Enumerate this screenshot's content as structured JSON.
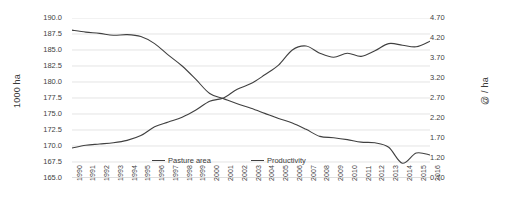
{
  "chart_data": {
    "type": "line",
    "title": "",
    "xlabel": "",
    "ylabel": "1000 ha",
    "y2label": "@ / ha",
    "grid": true,
    "legend_position": "bottom-center",
    "x": [
      1990,
      1991,
      1992,
      1993,
      1994,
      1995,
      1996,
      1997,
      1998,
      1999,
      2000,
      2001,
      2002,
      2003,
      2004,
      2005,
      2006,
      2007,
      2008,
      2009,
      2010,
      2011,
      2012,
      2013,
      2014,
      2015,
      2016
    ],
    "xtick_labels": [
      "1990",
      "1991",
      "1992",
      "1993",
      "1994",
      "1995",
      "1996",
      "1997",
      "1998",
      "1999",
      "2000",
      "2001",
      "2002",
      "2003",
      "2004",
      "2005",
      "2006",
      "2007",
      "2008",
      "2009",
      "2010",
      "2011",
      "2012",
      "2013",
      "2014",
      "2015",
      "2016"
    ],
    "ylim": [
      165.0,
      190.0
    ],
    "ytick_labels": [
      "190.0",
      "187.5",
      "185.0",
      "182.5",
      "180.0",
      "177.5",
      "175.0",
      "172.5",
      "170.0",
      "167.5",
      "165.0"
    ],
    "ytick_values": [
      190.0,
      187.5,
      185.0,
      182.5,
      180.0,
      177.5,
      175.0,
      172.5,
      170.0,
      167.5,
      165.0
    ],
    "y2lim": [
      0.7,
      4.7
    ],
    "y2tick_labels": [
      "4.70",
      "4.20",
      "3.70",
      "3.20",
      "2.70",
      "2.20",
      "1.70",
      "1.20",
      "0.70"
    ],
    "y2tick_values": [
      4.7,
      4.2,
      3.7,
      3.2,
      2.7,
      2.2,
      1.7,
      1.2,
      0.7
    ],
    "series": [
      {
        "name": "Pasture area",
        "axis": "left",
        "color": "#404040",
        "values": [
          188.1,
          187.8,
          187.6,
          187.3,
          187.4,
          187.1,
          186.0,
          184.2,
          182.5,
          180.4,
          178.2,
          177.4,
          176.6,
          175.9,
          175.1,
          174.3,
          173.6,
          172.6,
          171.5,
          171.3,
          171.0,
          170.6,
          170.5,
          169.8,
          167.3,
          168.9,
          168.6
        ]
      },
      {
        "name": "Productivity",
        "axis": "right",
        "color": "#404040",
        "values": [
          1.45,
          1.52,
          1.55,
          1.58,
          1.64,
          1.76,
          1.98,
          2.1,
          2.22,
          2.4,
          2.62,
          2.7,
          2.92,
          3.06,
          3.28,
          3.52,
          3.9,
          4.0,
          3.82,
          3.72,
          3.82,
          3.74,
          3.88,
          4.06,
          4.02,
          3.98,
          4.12
        ]
      }
    ]
  },
  "legend": {
    "items": [
      {
        "label": "Pasture area"
      },
      {
        "label": "Productivity"
      }
    ]
  }
}
